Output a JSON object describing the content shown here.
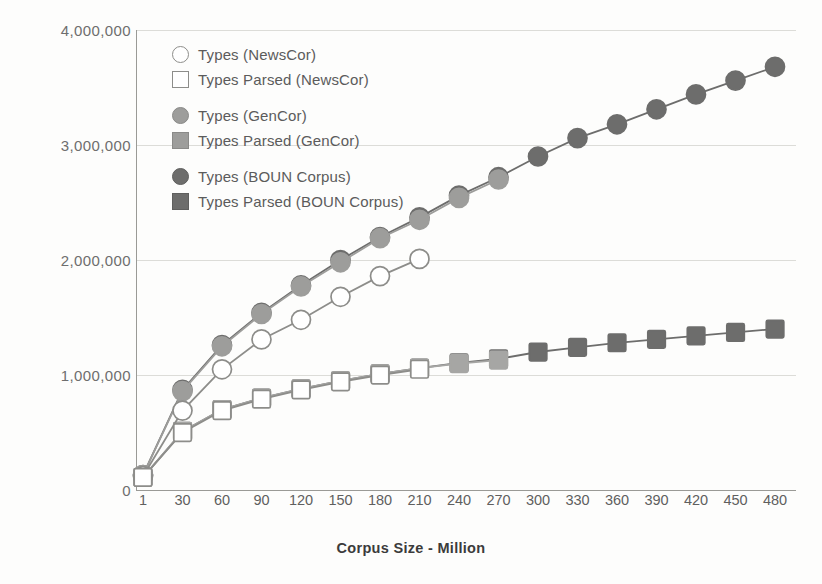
{
  "chart_data": {
    "type": "line",
    "title": "",
    "xlabel": "Corpus Size - Million",
    "ylabel": "",
    "grid": true,
    "legend_position": "top-left-inside",
    "categories": [
      "1",
      "30",
      "60",
      "90",
      "120",
      "150",
      "180",
      "210",
      "240",
      "270",
      "300",
      "330",
      "360",
      "390",
      "420",
      "450",
      "480"
    ],
    "x_tick_labels": [
      "1",
      "30",
      "60",
      "90",
      "120",
      "150",
      "180",
      "210",
      "240",
      "270",
      "300",
      "330",
      "360",
      "390",
      "420",
      "450",
      "480"
    ],
    "y_tick_labels": [
      "0",
      "1,000,000",
      "2,000,000",
      "3,000,000",
      "4,000,000"
    ],
    "y_tick_values": [
      0,
      1000000,
      2000000,
      3000000,
      4000000
    ],
    "ylim": [
      0,
      4000000
    ],
    "series": [
      {
        "name": "Types (NewsCor)",
        "marker": "open-circle",
        "color": "#8d8d8a",
        "fill": "#ffffff",
        "x": [
          "1",
          "30",
          "60",
          "90",
          "120",
          "150",
          "180",
          "210"
        ],
        "values": [
          120000,
          690000,
          1050000,
          1310000,
          1480000,
          1680000,
          1860000,
          2010000
        ]
      },
      {
        "name": "Types Parsed (NewsCor)",
        "marker": "open-square",
        "color": "#8d8d8a",
        "fill": "#ffffff",
        "x": [
          "1",
          "30",
          "60",
          "90",
          "120",
          "150",
          "180",
          "210"
        ],
        "values": [
          110000,
          500000,
          690000,
          790000,
          870000,
          940000,
          1000000,
          1050000
        ]
      },
      {
        "name": "Types (GenCor)",
        "marker": "filled-circle",
        "color": "#9d9d9b",
        "fill": "#9d9d9b",
        "x": [
          "1",
          "30",
          "60",
          "90",
          "120",
          "150",
          "180",
          "210",
          "240",
          "270"
        ],
        "values": [
          130000,
          860000,
          1250000,
          1530000,
          1770000,
          1980000,
          2190000,
          2350000,
          2540000,
          2700000
        ]
      },
      {
        "name": "Types Parsed (GenCor)",
        "marker": "filled-square",
        "color": "#a6a6a4",
        "fill": "#a6a6a4",
        "x": [
          "1",
          "30",
          "60",
          "90",
          "120",
          "150",
          "180",
          "210",
          "240",
          "270"
        ],
        "values": [
          110000,
          510000,
          700000,
          800000,
          880000,
          950000,
          1010000,
          1060000,
          1100000,
          1130000
        ]
      },
      {
        "name": "Types (BOUN Corpus)",
        "marker": "filled-circle",
        "color": "#6d6d6c",
        "fill": "#6d6d6c",
        "x": [
          "1",
          "30",
          "60",
          "90",
          "120",
          "150",
          "180",
          "210",
          "240",
          "270",
          "300",
          "330",
          "360",
          "390",
          "420",
          "450",
          "480"
        ],
        "values": [
          130000,
          870000,
          1260000,
          1540000,
          1780000,
          2000000,
          2200000,
          2370000,
          2560000,
          2720000,
          2900000,
          3060000,
          3180000,
          3310000,
          3440000,
          3560000,
          3680000
        ]
      },
      {
        "name": "Types Parsed (BOUN Corpus)",
        "marker": "filled-square",
        "color": "#6d6d6c",
        "fill": "#6d6d6c",
        "x": [
          "1",
          "30",
          "60",
          "90",
          "120",
          "150",
          "180",
          "210",
          "240",
          "270",
          "300",
          "330",
          "360",
          "390",
          "420",
          "450",
          "480"
        ],
        "values": [
          110000,
          510000,
          700000,
          800000,
          880000,
          950000,
          1010000,
          1060000,
          1105000,
          1140000,
          1200000,
          1240000,
          1280000,
          1310000,
          1340000,
          1370000,
          1400000
        ]
      }
    ]
  },
  "legend": {
    "items": [
      {
        "label": "Types (NewsCor)",
        "swatch": "open-circle-swatch"
      },
      {
        "label": "Types Parsed (NewsCor)",
        "swatch": "open-square-swatch"
      },
      {
        "label": "Types (GenCor)",
        "swatch": "mid-circle-swatch"
      },
      {
        "label": "Types Parsed (GenCor)",
        "swatch": "mid-square-swatch"
      },
      {
        "label": "Types (BOUN Corpus)",
        "swatch": "dark-circle-swatch"
      },
      {
        "label": "Types Parsed (BOUN Corpus)",
        "swatch": "dark-square-swatch"
      }
    ]
  },
  "colors": {
    "newscor": "#8d8d8a",
    "gencor": "#9d9d9b",
    "boun": "#6d6d6c",
    "gridline": "#dcdcd8",
    "axis": "#9a9a96",
    "tick_text": "#6e6e6e",
    "title_text": "#3b3b3b",
    "background": "#fdfdfc"
  }
}
